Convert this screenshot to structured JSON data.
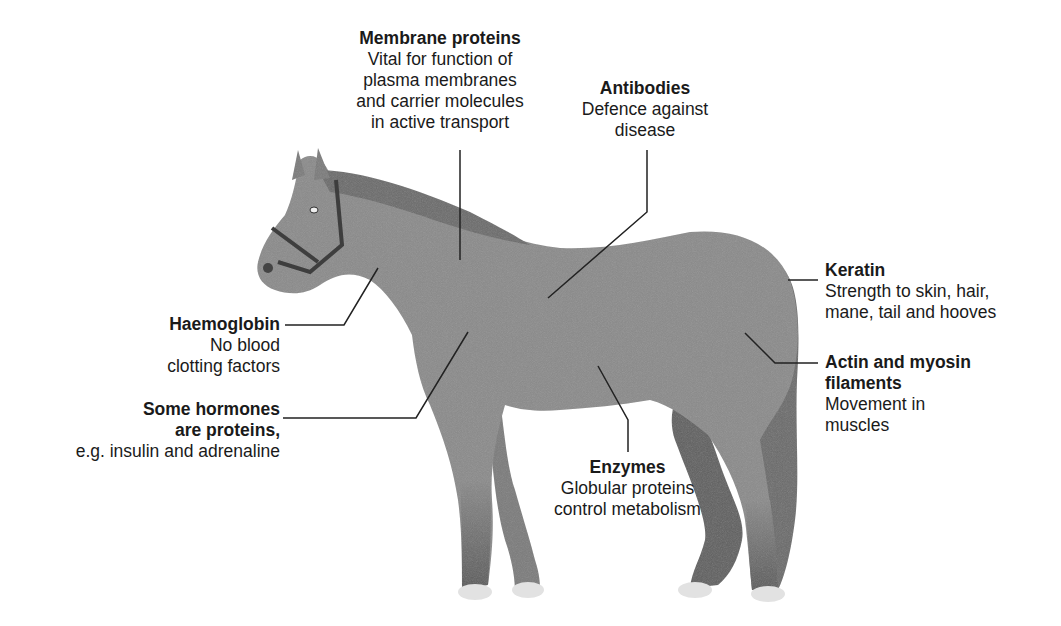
{
  "diagram": {
    "colors": {
      "body": "#8a8a8a",
      "mane": "#6a6a6a",
      "legs_dark": "#5e5e5e",
      "hooves": "#e2e2e2",
      "leader_line": "#222222",
      "text": "#1a1a1a"
    }
  },
  "labels": {
    "membrane": {
      "title": "Membrane proteins",
      "lines": [
        "Vital for function of",
        "plasma membranes",
        "and carrier molecules",
        "in active transport"
      ]
    },
    "antibodies": {
      "title": "Antibodies",
      "lines": [
        "Defence against",
        "disease"
      ]
    },
    "keratin": {
      "title": "Keratin",
      "lines": [
        "Strength to skin, hair,",
        "mane, tail and hooves"
      ]
    },
    "actin": {
      "title_lines": [
        "Actin and myosin",
        "filaments"
      ],
      "lines": [
        "Movement in",
        "muscles"
      ]
    },
    "haemoglobin": {
      "title": "Haemoglobin",
      "lines": [
        "No blood",
        "clotting factors"
      ]
    },
    "hormones": {
      "title_lines": [
        "Some hormones",
        "are proteins,"
      ],
      "lines": [
        "e.g. insulin and adrenaline"
      ]
    },
    "enzymes": {
      "title": "Enzymes",
      "lines": [
        "Globular proteins",
        "control metabolism"
      ]
    }
  }
}
